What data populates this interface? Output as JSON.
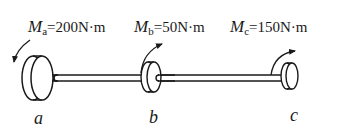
{
  "diagram": {
    "type": "shaft-torque",
    "torques": [
      {
        "symbol": "M",
        "subscript": "a",
        "value": "200",
        "unit": "N·m",
        "text": "=200N·m"
      },
      {
        "symbol": "M",
        "subscript": "b",
        "value": "50",
        "unit": "N·m",
        "text": "=50N·m"
      },
      {
        "symbol": "M",
        "subscript": "c",
        "value": "150",
        "unit": "N·m",
        "text": "=150N·m"
      }
    ],
    "disks": [
      {
        "label": "a"
      },
      {
        "label": "b"
      },
      {
        "label": "c"
      }
    ],
    "colors": {
      "stroke": "#1a1a1a",
      "background": "#ffffff"
    }
  }
}
